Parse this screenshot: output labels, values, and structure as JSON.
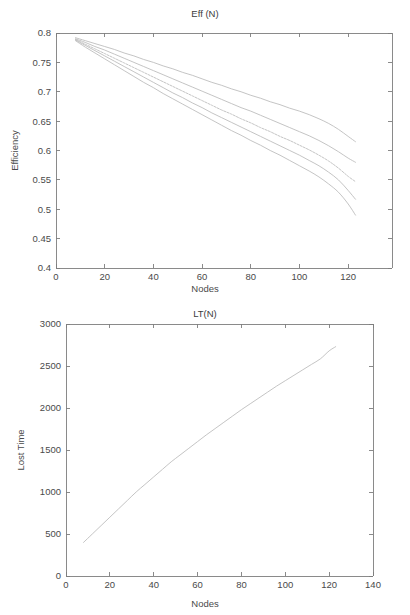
{
  "page": {
    "background_color": "#ffffff",
    "axis_color": "#7d7d7d",
    "series_color": "#b9b9b9",
    "text_color": "#4a4a4a"
  },
  "figures": [
    {
      "id": "eff",
      "title": "Eff (N)",
      "xlabel": "Nodes",
      "ylabel": "Efficiency"
    },
    {
      "id": "lt",
      "title": "LT(N)",
      "xlabel": "Nodes",
      "ylabel": "Lost Time"
    }
  ],
  "chart_data": [
    {
      "type": "line",
      "title": "Eff (N)",
      "xlabel": "Nodes",
      "ylabel": "Efficiency",
      "xlim": [
        0,
        138
      ],
      "ylim": [
        0.4,
        0.8
      ],
      "xticks": [
        0,
        20,
        40,
        60,
        80,
        100,
        120
      ],
      "xticklabels": [
        "0",
        "20",
        "40",
        "60",
        "80",
        "100",
        "120"
      ],
      "yticks": [
        0.4,
        0.45,
        0.5,
        0.55,
        0.6,
        0.65,
        0.7,
        0.75,
        0.8
      ],
      "yticklabels": [
        "0.4",
        "0.45",
        "0.5",
        "0.55",
        "0.6",
        "0.65",
        "0.7",
        "0.75",
        "0.8"
      ],
      "grid": false,
      "legend": null,
      "x": [
        8,
        12,
        16,
        20,
        24,
        28,
        32,
        36,
        40,
        44,
        48,
        52,
        56,
        60,
        64,
        68,
        72,
        76,
        80,
        84,
        88,
        92,
        96,
        100,
        104,
        108,
        112,
        116,
        120,
        123
      ],
      "series": [
        {
          "name": "curve-1",
          "style": "solid",
          "values": [
            0.792,
            0.787,
            0.782,
            0.777,
            0.772,
            0.766,
            0.761,
            0.755,
            0.75,
            0.744,
            0.739,
            0.733,
            0.728,
            0.722,
            0.716,
            0.711,
            0.705,
            0.7,
            0.694,
            0.689,
            0.683,
            0.678,
            0.672,
            0.667,
            0.661,
            0.654,
            0.646,
            0.636,
            0.624,
            0.615
          ]
        },
        {
          "name": "curve-2",
          "style": "solid",
          "values": [
            0.79,
            0.784,
            0.777,
            0.771,
            0.764,
            0.757,
            0.75,
            0.743,
            0.736,
            0.729,
            0.722,
            0.715,
            0.708,
            0.701,
            0.694,
            0.687,
            0.68,
            0.673,
            0.667,
            0.66,
            0.653,
            0.646,
            0.639,
            0.632,
            0.625,
            0.617,
            0.608,
            0.598,
            0.587,
            0.58
          ]
        },
        {
          "name": "curve-3",
          "style": "dashed",
          "values": [
            0.789,
            0.781,
            0.773,
            0.765,
            0.757,
            0.749,
            0.741,
            0.733,
            0.725,
            0.717,
            0.709,
            0.701,
            0.693,
            0.685,
            0.677,
            0.669,
            0.662,
            0.654,
            0.647,
            0.639,
            0.632,
            0.624,
            0.617,
            0.609,
            0.601,
            0.592,
            0.582,
            0.57,
            0.556,
            0.547
          ]
        },
        {
          "name": "curve-4",
          "style": "solid",
          "values": [
            0.788,
            0.779,
            0.77,
            0.761,
            0.752,
            0.743,
            0.734,
            0.725,
            0.716,
            0.707,
            0.698,
            0.69,
            0.681,
            0.673,
            0.664,
            0.656,
            0.648,
            0.64,
            0.632,
            0.624,
            0.616,
            0.608,
            0.6,
            0.592,
            0.583,
            0.574,
            0.563,
            0.55,
            0.532,
            0.517
          ]
        },
        {
          "name": "curve-5",
          "style": "solid",
          "values": [
            0.787,
            0.776,
            0.766,
            0.756,
            0.746,
            0.736,
            0.726,
            0.716,
            0.707,
            0.697,
            0.688,
            0.679,
            0.67,
            0.661,
            0.652,
            0.643,
            0.634,
            0.626,
            0.617,
            0.609,
            0.6,
            0.592,
            0.583,
            0.574,
            0.565,
            0.555,
            0.543,
            0.529,
            0.509,
            0.49
          ]
        }
      ]
    },
    {
      "type": "line",
      "title": "LT(N)",
      "xlabel": "Nodes",
      "ylabel": "Lost Time",
      "xlim": [
        0,
        140
      ],
      "ylim": [
        0,
        3000
      ],
      "xticks": [
        0,
        20,
        40,
        60,
        80,
        100,
        120,
        140
      ],
      "xticklabels": [
        "0",
        "20",
        "40",
        "60",
        "80",
        "100",
        "120",
        "140"
      ],
      "yticks": [
        0,
        500,
        1000,
        1500,
        2000,
        2500,
        3000
      ],
      "yticklabels": [
        "0",
        "500",
        "1000",
        "1500",
        "2000",
        "2500",
        "3000"
      ],
      "grid": false,
      "legend": null,
      "x": [
        8,
        12,
        16,
        20,
        24,
        28,
        32,
        36,
        40,
        44,
        48,
        52,
        56,
        60,
        64,
        68,
        72,
        76,
        80,
        84,
        88,
        92,
        96,
        100,
        104,
        108,
        112,
        116,
        120,
        123
      ],
      "series": [
        {
          "name": "lost-time",
          "style": "solid",
          "values": [
            400,
            500,
            600,
            700,
            800,
            900,
            1000,
            1090,
            1180,
            1270,
            1360,
            1440,
            1520,
            1600,
            1680,
            1755,
            1830,
            1905,
            1980,
            2050,
            2120,
            2190,
            2260,
            2325,
            2390,
            2455,
            2520,
            2585,
            2680,
            2730
          ]
        }
      ]
    }
  ]
}
